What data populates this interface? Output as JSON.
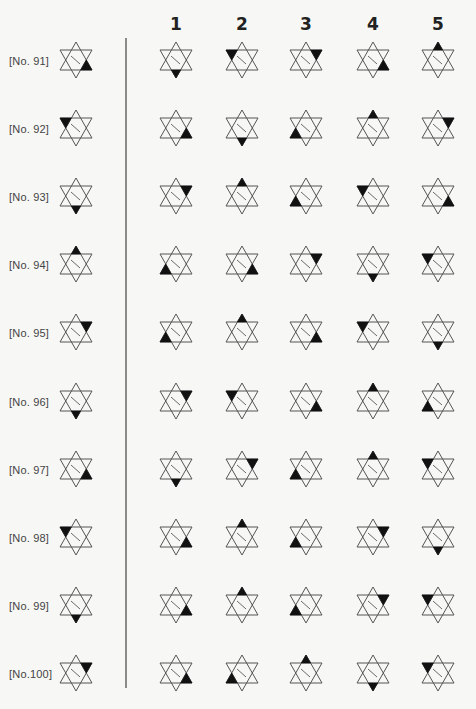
{
  "columns": [
    "1",
    "2",
    "3",
    "4",
    "5"
  ],
  "column_x": [
    176,
    242,
    306,
    373,
    438
  ],
  "label_star_x": 76,
  "row_top": [
    40,
    108,
    176,
    244,
    312,
    381,
    449,
    517,
    585,
    653
  ],
  "rows": [
    {
      "label": "[No. 91]",
      "problem": "lower-right",
      "options": [
        "bottom",
        "upper-left",
        "upper-right",
        "lower-right",
        "top"
      ]
    },
    {
      "label": "[No. 92]",
      "problem": "upper-left",
      "options": [
        "lower-right",
        "bottom",
        "lower-left",
        "top",
        "upper-right"
      ]
    },
    {
      "label": "[No. 93]",
      "problem": "bottom",
      "options": [
        "upper-right",
        "top",
        "lower-left",
        "upper-left",
        "lower-right"
      ]
    },
    {
      "label": "[No. 94]",
      "problem": "top",
      "options": [
        "lower-left",
        "lower-right",
        "upper-right",
        "bottom",
        "upper-left"
      ]
    },
    {
      "label": "[No. 95]",
      "problem": "upper-right",
      "options": [
        "lower-left",
        "top",
        "lower-right",
        "upper-left",
        "bottom"
      ]
    },
    {
      "label": "[No. 96]",
      "problem": "bottom",
      "options": [
        "upper-right",
        "upper-left",
        "lower-right",
        "top",
        "lower-left"
      ]
    },
    {
      "label": "[No. 97]",
      "problem": "lower-right",
      "options": [
        "bottom",
        "upper-right",
        "lower-left",
        "top",
        "upper-left"
      ]
    },
    {
      "label": "[No. 98]",
      "problem": "upper-left",
      "options": [
        "lower-right",
        "top",
        "lower-left",
        "upper-right",
        "bottom"
      ]
    },
    {
      "label": "[No. 99]",
      "problem": "bottom",
      "options": [
        "lower-right",
        "top",
        "lower-left",
        "upper-right",
        "upper-left"
      ]
    },
    {
      "label": "[No.100]",
      "problem": "upper-right",
      "options": [
        "lower-right",
        "lower-left",
        "top",
        "bottom",
        "upper-left"
      ]
    }
  ],
  "icons": {
    "star": "hexagram-icon",
    "filled_point": "black-triangle-point"
  },
  "colors": {
    "background": "#f7f7f5",
    "line": "#555555",
    "fill": "#111111",
    "divider": "#8a8a8a"
  }
}
